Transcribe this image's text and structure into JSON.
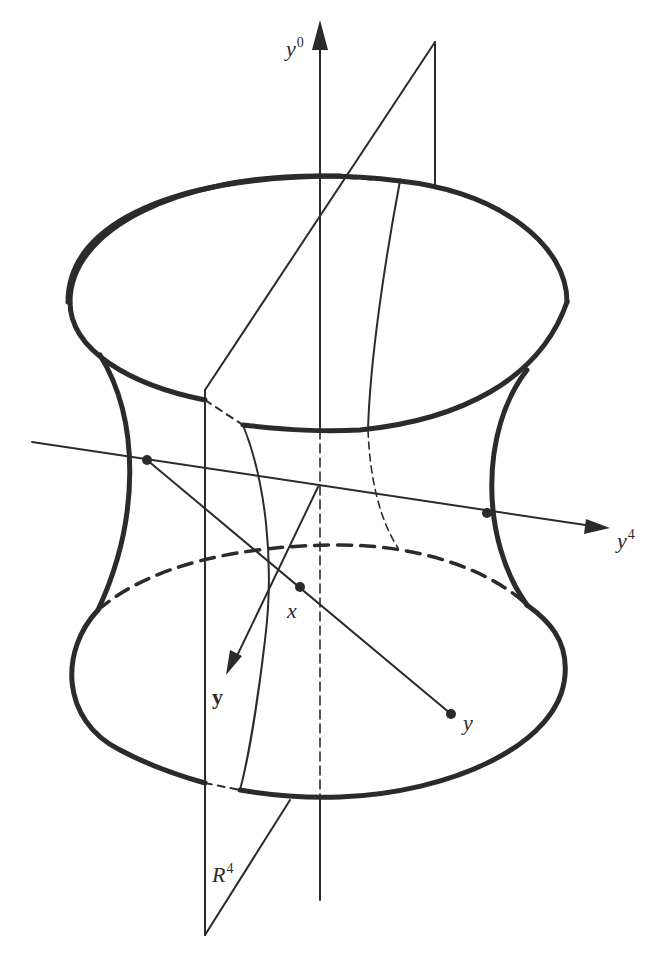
{
  "figure": {
    "type": "hyperboloid diagram",
    "colors": {
      "ink": "#2b2b2b",
      "background": "#ffffff"
    },
    "axes": {
      "y0": {
        "base": "y",
        "sup": "0"
      },
      "y4": {
        "base": "y",
        "sup": "4"
      },
      "y_vec": {
        "label": "y"
      }
    },
    "points": {
      "x": {
        "label": "x"
      },
      "y": {
        "label": "y"
      }
    },
    "plane": {
      "base": "R",
      "sup": "4"
    }
  }
}
